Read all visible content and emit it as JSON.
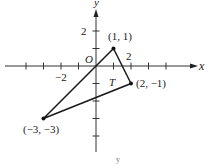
{
  "diagram": {
    "axes": {
      "x_label": "x",
      "y_label": "y",
      "origin_label": "O",
      "x_tick_label": "2",
      "x_neg_tick_label": "−2",
      "y_tick_label": "2"
    },
    "triangle": {
      "label": "T",
      "vertices": [
        {
          "label": "(1, 1)",
          "x": 1,
          "y": 1
        },
        {
          "label": "(2, −1)",
          "x": 2,
          "y": -1
        },
        {
          "label": "(−3, −3)",
          "x": -3,
          "y": -3
        }
      ]
    },
    "footer_label": "y",
    "colors": {
      "axis": "#333333",
      "edge": "#1a1a1a",
      "text": "#222222",
      "background": "#ffffff"
    }
  }
}
